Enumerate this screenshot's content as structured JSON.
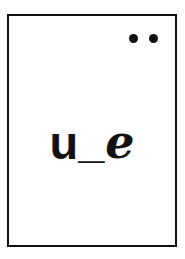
{
  "card": {
    "name": "phonics-flashcard",
    "background_color": "#ffffff",
    "border_color": "#111111",
    "ink_color": "#111111"
  },
  "markers": {
    "name": "corner-dot-pair",
    "count": 2,
    "dots": [
      {
        "label": "dot-1"
      },
      {
        "label": "dot-2"
      }
    ]
  },
  "content": {
    "grapheme": "u_e",
    "parts": {
      "letter_first": "u",
      "separator": "_",
      "letter_last": "e"
    }
  }
}
